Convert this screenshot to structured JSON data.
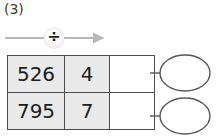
{
  "item": {
    "number_label": "(3)"
  },
  "operation": {
    "symbol": "÷",
    "name": "division",
    "arrow_icon": "right-arrow-icon",
    "badge_icon": "divide-icon"
  },
  "table": {
    "columns": [
      {
        "key": "dividend",
        "header": "",
        "shaded": true
      },
      {
        "key": "divisor",
        "header": "",
        "shaded": true
      },
      {
        "key": "answer",
        "header": "",
        "shaded": false
      }
    ],
    "rows": [
      {
        "dividend": "526",
        "divisor": "4",
        "answer": ""
      },
      {
        "dividend": "795",
        "divisor": "7",
        "answer": ""
      }
    ]
  },
  "remainder_bubbles": [
    {
      "label": "",
      "shape": "ellipse"
    },
    {
      "label": "",
      "shape": "ellipse"
    }
  ],
  "colors": {
    "cell_shade": "#e9e9e9",
    "cell_blank": "#ffffff",
    "border": "#4d4d4d",
    "text": "#1c1c1c",
    "arrow": "#b8b8b8",
    "oval_stroke": "#58585a"
  }
}
